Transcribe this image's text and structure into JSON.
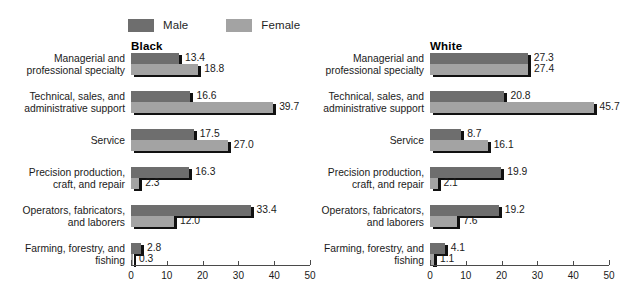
{
  "legend": {
    "entries": [
      {
        "label": "Male",
        "color": "#6e6e6e",
        "icon": "male-swatch"
      },
      {
        "label": "Female",
        "color": "#a3a3a3",
        "icon": "female-swatch"
      }
    ]
  },
  "categories": [
    "Managerial and\nprofessional specialty",
    "Technical, sales, and\nadministrative support",
    "Service",
    "Precision production,\ncraft, and repair",
    "Operators, fabricators,\nand laborers",
    "Farming, forestry, and\nfishing"
  ],
  "panels": [
    {
      "title": "Black"
    },
    {
      "title": "White"
    }
  ],
  "axis": {
    "ticks": [
      "0",
      "10",
      "20",
      "30",
      "40",
      "50"
    ],
    "min": 0,
    "max": 50
  },
  "chart_data": {
    "type": "bar",
    "title": "",
    "xlabel": "",
    "ylabel": "",
    "orientation": "horizontal",
    "grid": false,
    "legend_position": "top",
    "xlim": [
      0,
      50
    ],
    "xticks": [
      0,
      10,
      20,
      30,
      40,
      50
    ],
    "categories": [
      "Managerial and professional specialty",
      "Technical, sales, and administrative support",
      "Service",
      "Precision production, craft, and repair",
      "Operators, fabricators, and laborers",
      "Farming, forestry, and fishing"
    ],
    "panels": [
      {
        "name": "Black",
        "series": [
          {
            "name": "Male",
            "values": [
              13.4,
              16.6,
              17.5,
              16.3,
              33.4,
              2.8
            ]
          },
          {
            "name": "Female",
            "values": [
              18.8,
              39.7,
              27.0,
              2.3,
              12.0,
              0.3
            ]
          }
        ]
      },
      {
        "name": "White",
        "series": [
          {
            "name": "Male",
            "values": [
              27.3,
              20.8,
              8.7,
              19.9,
              19.2,
              4.1
            ]
          },
          {
            "name": "Female",
            "values": [
              27.4,
              45.7,
              16.1,
              2.1,
              7.6,
              1.1
            ]
          }
        ]
      }
    ]
  }
}
